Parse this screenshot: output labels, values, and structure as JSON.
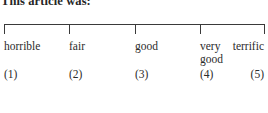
{
  "survey": {
    "prompt": "This article was:",
    "scale": {
      "axis_color": "#3a3a3a",
      "text_color": "#2b2b2b",
      "background": "#ffffff",
      "tick_count": 5,
      "points": [
        {
          "label": "horrible",
          "number": "(1)",
          "value": 1,
          "x": 4,
          "anchor": "left"
        },
        {
          "label": "fair",
          "number": "(2)",
          "value": 2,
          "x": 69,
          "anchor": "left"
        },
        {
          "label": "good",
          "number": "(3)",
          "value": 3,
          "x": 135,
          "anchor": "left"
        },
        {
          "label": "very\ngood",
          "number": "(4)",
          "value": 4,
          "x": 200,
          "anchor": "left"
        },
        {
          "label": "terrific",
          "number": "(5)",
          "value": 5,
          "x": 264,
          "anchor": "right"
        }
      ]
    }
  }
}
